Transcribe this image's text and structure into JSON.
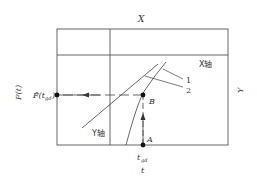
{
  "diagram": {
    "top_label": "X",
    "right_label": "Y",
    "left_label": "F(t)",
    "bottom_label": "t",
    "x_axis_label": "X轴",
    "y_axis_label": "Y轴",
    "point_a": "A",
    "point_b": "B",
    "t_gd": "t",
    "t_gd_sub": "gd",
    "f_hat": "F̂(t",
    "f_hat_sub": "gd",
    "f_hat_close": ")",
    "curve_1": "1",
    "curve_2": "2",
    "colors": {
      "line": "#444444",
      "text": "#333333"
    }
  }
}
